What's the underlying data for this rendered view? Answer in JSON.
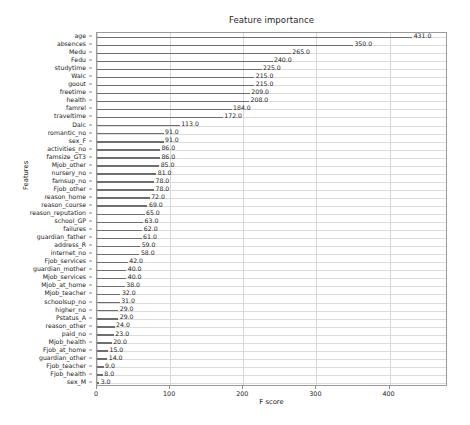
{
  "chart_data": {
    "type": "bar",
    "orientation": "horizontal",
    "title": "Feature importance",
    "xlabel": "F score",
    "ylabel": "Features",
    "xlim": [
      0,
      480
    ],
    "xticks": [
      0,
      100,
      200,
      300,
      400
    ],
    "xticklabels": [
      "0",
      "100",
      "200",
      "300",
      "400"
    ],
    "grid": true,
    "legend": null,
    "bar_color": "#6e6e6e",
    "categories": [
      "age",
      "absences",
      "Medu",
      "Fedu",
      "studytime",
      "Walc",
      "goout",
      "freetime",
      "health",
      "famrel",
      "traveltime",
      "Dalc",
      "romantic_no",
      "sex_F",
      "activities_no",
      "famsize_GT3",
      "Mjob_other",
      "nursery_no",
      "famsup_no",
      "Fjob_other",
      "reason_home",
      "reason_course",
      "reason_reputation",
      "school_GP",
      "failures",
      "guardian_father",
      "address_R",
      "internet_no",
      "Fjob_services",
      "guardian_mother",
      "Mjob_services",
      "Mjob_at_home",
      "Mjob_teacher",
      "schoolsup_no",
      "higher_no",
      "Pstatus_A",
      "reason_other",
      "paid_no",
      "Mjob_health",
      "Fjob_at_home",
      "guardian_other",
      "Fjob_teacher",
      "Fjob_health",
      "sex_M"
    ],
    "values": [
      431.0,
      350.0,
      265.0,
      240.0,
      225.0,
      215.0,
      215.0,
      209.0,
      208.0,
      184.0,
      172.0,
      113.0,
      91.0,
      91.0,
      86.0,
      86.0,
      85.0,
      81.0,
      78.0,
      78.0,
      72.0,
      69.0,
      65.0,
      63.0,
      62.0,
      61.0,
      59.0,
      58.0,
      42.0,
      40.0,
      40.0,
      38.0,
      32.0,
      31.0,
      29.0,
      29.0,
      24.0,
      23.0,
      20.0,
      15.0,
      14.0,
      9.0,
      8.0,
      3.0
    ],
    "value_labels": [
      "431.0",
      "350.0",
      "265.0",
      "240.0",
      "225.0",
      "215.0",
      "215.0",
      "209.0",
      "208.0",
      "184.0",
      "172.0",
      "113.0",
      "91.0",
      "91.0",
      "86.0",
      "86.0",
      "85.0",
      "81.0",
      "78.0",
      "78.0",
      "72.0",
      "69.0",
      "65.0",
      "63.0",
      "62.0",
      "61.0",
      "59.0",
      "58.0",
      "42.0",
      "40.0",
      "40.0",
      "38.0",
      "32.0",
      "31.0",
      "29.0",
      "29.0",
      "24.0",
      "23.0",
      "20.0",
      "15.0",
      "14.0",
      "9.0",
      "8.0",
      "3.0"
    ]
  }
}
